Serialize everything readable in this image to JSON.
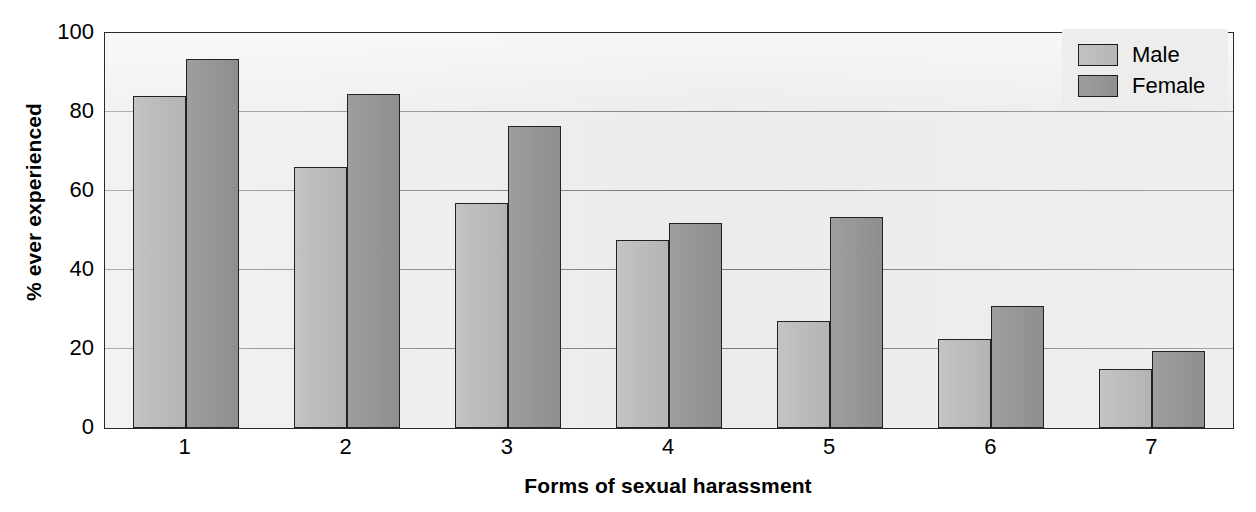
{
  "chart_data": {
    "type": "bar",
    "title": "",
    "xlabel": "Forms of sexual harassment",
    "ylabel": "% ever experienced",
    "categories": [
      "1",
      "2",
      "3",
      "4",
      "5",
      "6",
      "7"
    ],
    "series": [
      {
        "name": "Male",
        "color": "#b8b8b8",
        "values": [
          84,
          66,
          57,
          47.5,
          27,
          22.5,
          15
        ]
      },
      {
        "name": "Female",
        "color": "#949494",
        "values": [
          93.5,
          84.5,
          76.5,
          52,
          53.5,
          31,
          19.5
        ]
      }
    ],
    "ylim": [
      0,
      100
    ],
    "yticks": [
      "0",
      "20",
      "40",
      "60",
      "80",
      "100"
    ],
    "ytick_values": [
      0,
      20,
      40,
      60,
      80,
      100
    ],
    "grid": true,
    "legend_position": "top-right"
  },
  "legend": {
    "entries": [
      {
        "label": "Male"
      },
      {
        "label": "Female"
      }
    ]
  }
}
